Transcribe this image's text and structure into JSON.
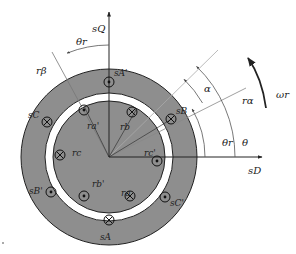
{
  "diagram": {
    "colors": {
      "iron": "#8e8e8e",
      "air_gap": "#ffffff",
      "lines": "#222222",
      "guide_lines": "#9a9a9a"
    },
    "axes": {
      "stator_direct": "sD",
      "stator_quadrature": "sQ",
      "rotor_alpha": "rα",
      "rotor_beta": "rβ"
    },
    "angles": {
      "rotor_angle": "θr",
      "rotor_angle_top": "θr",
      "theta": "θ",
      "alpha": "α",
      "angular_speed": "ωr"
    },
    "stator_conductors": [
      {
        "label": "sA'",
        "type": "dot"
      },
      {
        "label": "sB",
        "type": "cross"
      },
      {
        "label": "sC'",
        "type": "dot"
      },
      {
        "label": "sA",
        "type": "cross"
      },
      {
        "label": "sB'",
        "type": "dot"
      },
      {
        "label": "sC",
        "type": "cross"
      }
    ],
    "rotor_conductors": [
      {
        "label": "ra'",
        "type": "dot"
      },
      {
        "label": "rb",
        "type": "cross"
      },
      {
        "label": "rc'",
        "type": "dot"
      },
      {
        "label": "ra",
        "type": "cross"
      },
      {
        "label": "rb'",
        "type": "dot"
      },
      {
        "label": "rc",
        "type": "cross"
      }
    ]
  }
}
